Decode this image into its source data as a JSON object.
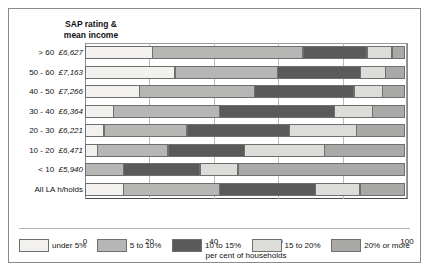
{
  "chart_data": {
    "type": "bar",
    "orientation": "horizontal",
    "stacked": true,
    "title": "",
    "axis_title": "SAP rating &\nmean income",
    "xlabel": "per cent  of households",
    "ylabel": "",
    "xlim": [
      0,
      100
    ],
    "xticks": [
      0,
      20,
      40,
      60,
      80,
      100
    ],
    "grid": true,
    "legend_position": "bottom",
    "categories": [
      "> 60  £6,627",
      "50 - 60  £7,163",
      "40 - 50  £7,266",
      "30 - 40  £6,364",
      "20 - 30  £6,221",
      "10 - 20  £6,471",
      "< 10  £5,940",
      "All LA h/holds"
    ],
    "category_parts": [
      {
        "range": "> 60",
        "income": "£6,627"
      },
      {
        "range": "50 - 60",
        "income": "£7,163"
      },
      {
        "range": "40 - 50",
        "income": "£7,266"
      },
      {
        "range": "30 - 40",
        "income": "£6,364"
      },
      {
        "range": "20 - 30",
        "income": "£6,221"
      },
      {
        "range": "10 - 20",
        "income": "£6,471"
      },
      {
        "range": "< 10",
        "income": "£5,940"
      },
      {
        "range": "All LA h/holds",
        "income": ""
      }
    ],
    "series": [
      {
        "name": "under 5%",
        "color": "#f2f1ee",
        "values": [
          21,
          28,
          17,
          9,
          6,
          4,
          0,
          12
        ]
      },
      {
        "name": "5 to 10%",
        "color": "#b6b6b4",
        "values": [
          47,
          32,
          36,
          33,
          26,
          22,
          12,
          30
        ]
      },
      {
        "name": "10 to 15%",
        "color": "#5a5a5a",
        "values": [
          20,
          26,
          31,
          36,
          32,
          24,
          24,
          30
        ]
      },
      {
        "name": "15 to 20%",
        "color": "#dcdcd8",
        "values": [
          8,
          8,
          9,
          12,
          21,
          25,
          12,
          14
        ]
      },
      {
        "name": "20% or more",
        "color": "#a9a9a7",
        "values": [
          4,
          6,
          7,
          10,
          15,
          25,
          52,
          14
        ]
      }
    ]
  }
}
